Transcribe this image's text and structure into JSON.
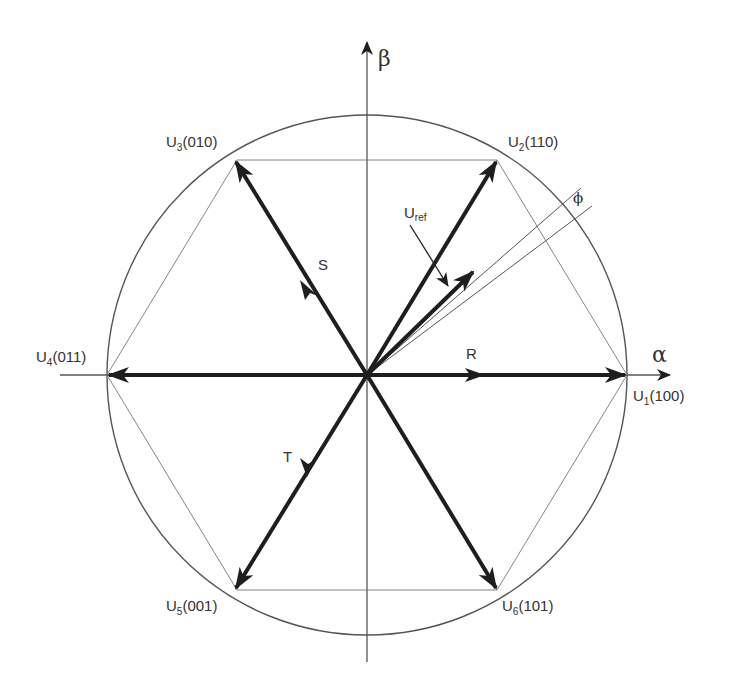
{
  "diagram": {
    "colors": {
      "background": "#ffffff",
      "vector": "#1e1e1e",
      "thin_line": "#555555",
      "text": "#333333"
    },
    "axes": {
      "alpha_label": "α",
      "beta_label": "β"
    },
    "vectors": [
      {
        "id": "U1",
        "base": "U",
        "sub": "1",
        "state": "(100)"
      },
      {
        "id": "U2",
        "base": "U",
        "sub": "2",
        "state": "(110)"
      },
      {
        "id": "U3",
        "base": "U",
        "sub": "3",
        "state": "(010)"
      },
      {
        "id": "U4",
        "base": "U",
        "sub": "4",
        "state": "(011)"
      },
      {
        "id": "U5",
        "base": "U",
        "sub": "5",
        "state": "(001)"
      },
      {
        "id": "U6",
        "base": "U",
        "sub": "6",
        "state": "(101)"
      }
    ],
    "phases": {
      "r": "R",
      "s": "S",
      "t": "T"
    },
    "reference": {
      "base": "U",
      "sub": "ref"
    },
    "angle_label": "ϕ"
  }
}
